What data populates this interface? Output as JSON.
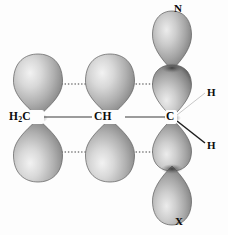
{
  "figure": {
    "background_color": "#fdfdfd",
    "width": 228,
    "height": 235
  },
  "palette": {
    "lobe_light": "#e9e9e9",
    "lobe_mid": "#b4b4b4",
    "lobe_dark": "#6e6e6e",
    "lobe_edge": "#4a4a4a",
    "bond_solid": "#3b3b3b",
    "bond_dotted": "#7d7d7d",
    "bond_light": "#cfcfcf",
    "text": "#0b0b0b"
  },
  "labels": {
    "left_carbon": "H",
    "left_carbon_sub": "2",
    "left_carbon_tail": "C",
    "middle_carbon": "CH",
    "right_carbon": "C",
    "top_substituent": "N",
    "bottom_substituent": "X",
    "hydrogen_upper": "H",
    "hydrogen_lower": "H"
  },
  "atoms": [
    {
      "name": "left-carbon",
      "label": "H2C",
      "x": 38,
      "y": 117
    },
    {
      "name": "middle-carbon",
      "label": "CH",
      "x": 110,
      "y": 117
    },
    {
      "name": "right-carbon",
      "label": "C",
      "x": 172,
      "y": 117
    }
  ],
  "orbital_lobes": [
    {
      "name": "left-p-upper",
      "cx": 38,
      "cy": 88,
      "direction": "up",
      "rx": 24,
      "ry": 32
    },
    {
      "name": "left-p-lower",
      "cx": 38,
      "cy": 148,
      "direction": "down",
      "rx": 24,
      "ry": 32
    },
    {
      "name": "middle-p-upper",
      "cx": 110,
      "cy": 88,
      "direction": "up",
      "rx": 24,
      "ry": 32
    },
    {
      "name": "middle-p-lower",
      "cx": 110,
      "cy": 148,
      "direction": "down",
      "rx": 24,
      "ry": 32
    },
    {
      "name": "right-p-upper",
      "cx": 172,
      "cy": 88,
      "direction": "up",
      "rx": 21,
      "ry": 30
    },
    {
      "name": "right-p-lower",
      "cx": 172,
      "cy": 148,
      "direction": "down",
      "rx": 21,
      "ry": 30
    },
    {
      "name": "nitrogen-lobe-top",
      "cx": 172,
      "cy": 40,
      "direction": "up",
      "rx": 21,
      "ry": 30
    },
    {
      "name": "x-lobe-bottom",
      "cx": 172,
      "cy": 196,
      "direction": "down",
      "rx": 21,
      "ry": 30
    }
  ],
  "bonds": {
    "sigma_bonds": [
      {
        "name": "sigma-h2c-ch",
        "x1": 44,
        "y1": 117,
        "x2": 93,
        "y2": 117,
        "style": "solid"
      },
      {
        "name": "sigma-ch-c",
        "x1": 126,
        "y1": 117,
        "x2": 165,
        "y2": 117,
        "style": "solid"
      }
    ],
    "pi_overlaps": [
      {
        "name": "pi-upper-left",
        "x1": 62,
        "y1": 84,
        "x2": 87,
        "y2": 84,
        "style": "dotted"
      },
      {
        "name": "pi-upper-right",
        "x1": 133,
        "y1": 84,
        "x2": 152,
        "y2": 84,
        "style": "dotted"
      },
      {
        "name": "pi-lower-left",
        "x1": 62,
        "y1": 152,
        "x2": 87,
        "y2": 152,
        "style": "dotted"
      },
      {
        "name": "pi-lower-right",
        "x1": 133,
        "y1": 152,
        "x2": 152,
        "y2": 152,
        "style": "dotted"
      }
    ],
    "hydrogen_bonds": [
      {
        "name": "bond-to-hydrogen-upper",
        "x1": 178,
        "y1": 114,
        "x2": 204,
        "y2": 93,
        "style": "light"
      },
      {
        "name": "bond-to-hydrogen-lower",
        "x1": 178,
        "y1": 121,
        "x2": 204,
        "y2": 143,
        "style": "dark"
      }
    ]
  }
}
